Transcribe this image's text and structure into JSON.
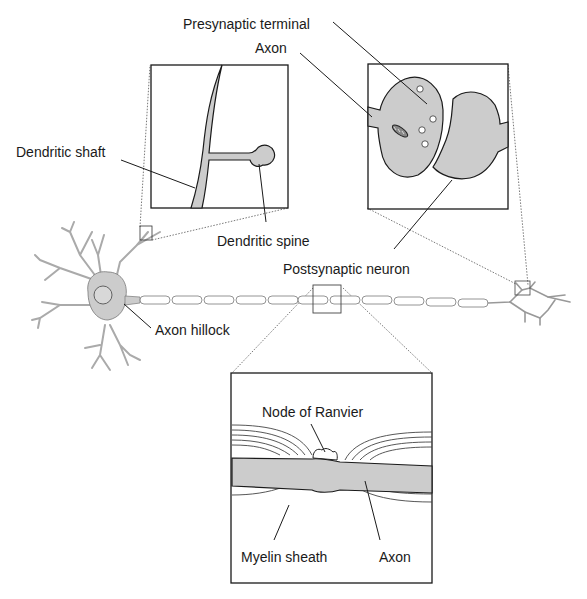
{
  "diagram": {
    "labels": {
      "presynaptic_terminal": "Presynaptic terminal",
      "axon_top": "Axon",
      "dendritic_shaft": "Dendritic shaft",
      "dendritic_spine": "Dendritic spine",
      "postsynaptic_neuron": "Postsynaptic neuron",
      "axon_hillock": "Axon hillock",
      "node_of_ranvier": "Node of Ranvier",
      "myelin_sheath": "Myelin sheath",
      "axon_bottom": "Axon"
    },
    "insets": [
      {
        "name": "dendrite-inset",
        "shows": [
          "Dendritic shaft",
          "Dendritic spine"
        ]
      },
      {
        "name": "synapse-inset",
        "shows": [
          "Presynaptic terminal",
          "Axon",
          "Postsynaptic neuron"
        ]
      },
      {
        "name": "myelin-inset",
        "shows": [
          "Node of Ranvier",
          "Myelin sheath",
          "Axon"
        ]
      }
    ],
    "colors": {
      "cell_fill": "#cccccc",
      "outline": "#1a1a1a",
      "background": "#ffffff"
    }
  }
}
